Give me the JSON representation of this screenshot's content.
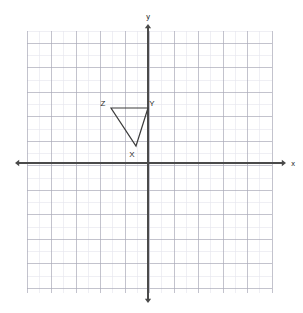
{
  "figure": {
    "type": "coordinate-plane-with-triangle",
    "background_color": "#ffffff",
    "grid": {
      "minor_color": "#e4e4ec",
      "major_color": "#a9a9b8",
      "left_px": 27,
      "top_px": 31,
      "right_px": 272,
      "bottom_px": 293,
      "cell_px": 12.25,
      "cols": 20,
      "rows": 21,
      "major_every": 2
    },
    "axes": {
      "color": "#4a4a4a",
      "origin_x_px": 148,
      "origin_y_px": 163,
      "x_axis_label": "x",
      "y_axis_label": "y",
      "x_label_x_px": 293,
      "x_label_y_px": 166,
      "y_label_x_px": 148,
      "y_label_y_px": 19,
      "x_left_arrow_px": 15,
      "x_right_arrow_px": 286,
      "y_top_arrow_px": 24,
      "y_bottom_arrow_px": 303
    },
    "shape": {
      "name": "triangle-xyz",
      "stroke_color": "#3c3c3c",
      "stroke_width": 1.2,
      "fill": "none",
      "vertices": [
        {
          "label": "X",
          "px_x": 136,
          "px_y": 146,
          "grid_x": -1,
          "grid_y": 1.5,
          "label_px_x": 132,
          "label_px_y": 157
        },
        {
          "label": "Y",
          "px_x": 148,
          "px_y": 108,
          "grid_x": 0,
          "grid_y": 4.5,
          "label_px_x": 152,
          "label_px_y": 106
        },
        {
          "label": "Z",
          "px_x": 111,
          "px_y": 108,
          "grid_x": -3,
          "grid_y": 4.5,
          "label_px_x": 103,
          "label_px_y": 106
        }
      ]
    }
  }
}
